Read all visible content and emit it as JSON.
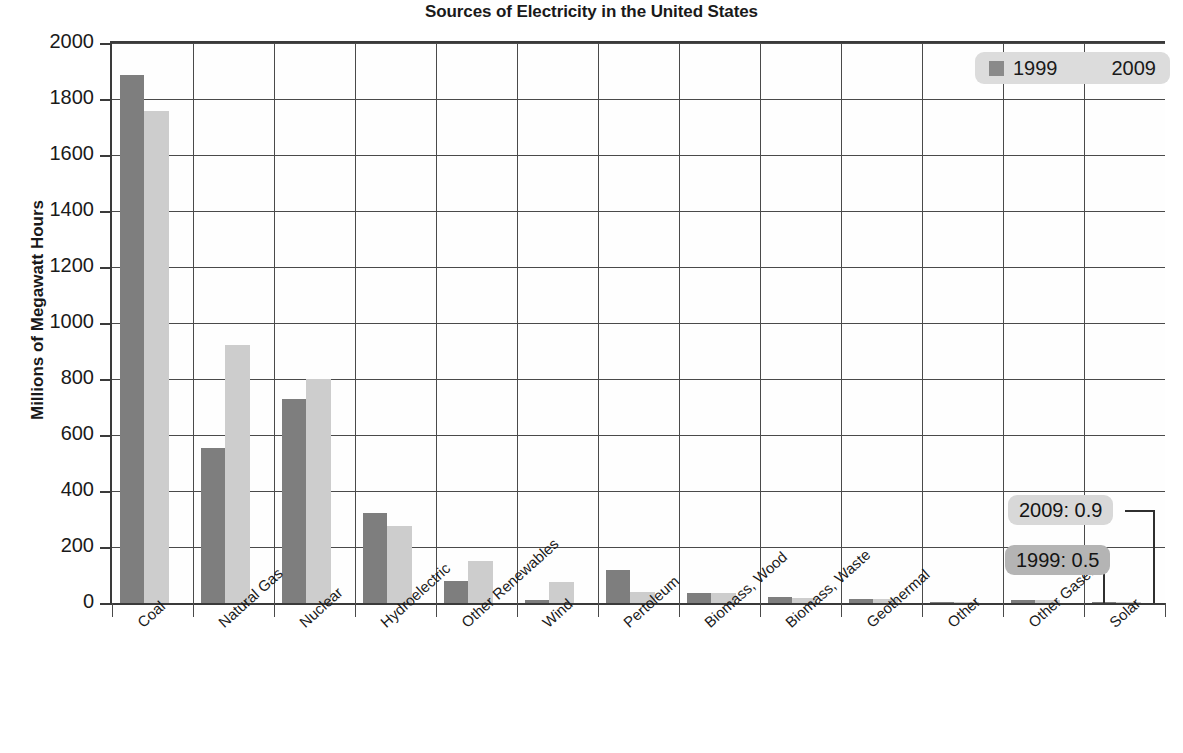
{
  "chart_data": {
    "type": "bar",
    "title": "Sources of Electricity in the United States",
    "xlabel": "",
    "ylabel": "Millions of Megawatt Hours",
    "ylim": [
      0,
      2000
    ],
    "ytick_step": 200,
    "yticks": [
      2000,
      1800,
      1600,
      1400,
      1200,
      1000,
      800,
      600,
      400,
      200,
      0
    ],
    "grid": true,
    "legend_position": "top-right",
    "categories": [
      "Coal",
      "Natural Gas",
      "Nuclear",
      "Hydroelectric",
      "Other Renewables",
      "Wind",
      "Pertoleum",
      "Biomass, Wood",
      "Biomass, Waste",
      "Geothermal",
      "Other",
      "Other Gases",
      "Solar"
    ],
    "series": [
      {
        "name": "1999",
        "color": "#7e7e7e",
        "values": [
          1884,
          552,
          728,
          321,
          79,
          12,
          118,
          37,
          22,
          15,
          4,
          9,
          0.5
        ]
      },
      {
        "name": "2009",
        "color": "#cdcdcd",
        "values": [
          1756,
          921,
          799,
          276,
          151,
          74,
          39,
          37,
          18,
          15,
          3,
          10,
          0.9
        ]
      }
    ],
    "annotations": [
      {
        "id": "callout-2009",
        "text": "2009: 0.9",
        "series": "2009",
        "category": "Solar",
        "value": 0.9,
        "background": "#d8d8d8"
      },
      {
        "id": "callout-1999",
        "text": "1999: 0.5",
        "series": "1999",
        "category": "Solar",
        "value": 0.5,
        "background": "#b4b4b4"
      }
    ]
  },
  "legend": {
    "background": "#dcdcdc",
    "entries": [
      {
        "label": "1999",
        "swatch_color": "#8a8a8a"
      },
      {
        "label": "2009",
        "swatch_color": "#dcdcdc"
      }
    ]
  }
}
